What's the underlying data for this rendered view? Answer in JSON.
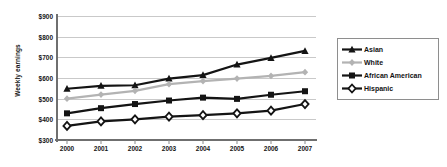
{
  "chart_data": {
    "type": "line",
    "title": "",
    "xlabel": "",
    "ylabel": "Weekly earnings",
    "categories": [
      "2000",
      "2001",
      "2002",
      "2003",
      "2004",
      "2005",
      "2006",
      "2007"
    ],
    "ylim": [
      300,
      900
    ],
    "ytick_values": [
      900,
      800,
      700,
      600,
      500,
      400,
      300
    ],
    "ytick_labels": [
      "$900",
      "$800",
      "$700",
      "$600",
      "$500",
      "$400",
      "$300"
    ],
    "grid": true,
    "legend_position": "right",
    "series": [
      {
        "name": "Asian",
        "color": "#141414",
        "marker": "triangle",
        "values": [
          548,
          562,
          565,
          597,
          614,
          665,
          697,
          731
        ]
      },
      {
        "name": "White",
        "color": "#b3b3b3",
        "marker": "diamond",
        "values": [
          500,
          520,
          538,
          570,
          585,
          597,
          610,
          628
        ]
      },
      {
        "name": "African American",
        "color": "#141414",
        "marker": "square",
        "values": [
          429,
          454,
          474,
          491,
          505,
          499,
          519,
          536
        ]
      },
      {
        "name": "Hispanic",
        "color": "#141414",
        "marker": "diamond-open",
        "values": [
          368,
          390,
          400,
          413,
          420,
          429,
          442,
          474
        ]
      }
    ]
  },
  "legend": {
    "items": [
      {
        "label": "Asian"
      },
      {
        "label": "White"
      },
      {
        "label": "African American"
      },
      {
        "label": "Hispanic"
      }
    ]
  }
}
